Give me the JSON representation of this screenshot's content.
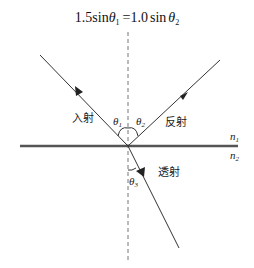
{
  "equation": {
    "lhs_coeff": "1.5",
    "lhs_fn": "sin",
    "lhs_var": "θ",
    "lhs_sub": "1",
    "equals": "=",
    "rhs_coeff": "1.0",
    "rhs_fn": "sin",
    "rhs_var": "θ",
    "rhs_sub": "2"
  },
  "labels": {
    "incident": "入射",
    "reflected": "反射",
    "transmitted": "透射"
  },
  "angles": {
    "theta1": {
      "sym": "θ",
      "sub": "1"
    },
    "theta2": {
      "sym": "θ",
      "sub": "2"
    },
    "theta3": {
      "sym": "θ",
      "sub": "3"
    }
  },
  "media": {
    "n1": {
      "sym": "n",
      "sub": "1"
    },
    "n2": {
      "sym": "n",
      "sub": "2"
    }
  },
  "colors": {
    "ray": "#333333",
    "interface": "#555555",
    "normal": "#777777"
  }
}
